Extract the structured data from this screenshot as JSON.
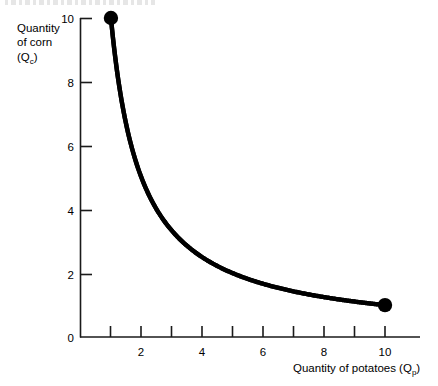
{
  "chart_data": {
    "type": "line",
    "title": "",
    "subtitle": "",
    "xlabel": "Quantity of potatoes (Qp)",
    "ylabel": "Quantity of corn (Qc)",
    "xlim": [
      0,
      11
    ],
    "ylim": [
      0,
      10
    ],
    "grid": false,
    "legend": "none",
    "x": [
      1,
      1.25,
      1.5,
      2,
      2.5,
      3,
      4,
      5,
      6,
      7,
      8,
      9,
      10
    ],
    "values": [
      10,
      8,
      6.67,
      5,
      4,
      3.33,
      2.5,
      2,
      1.67,
      1.43,
      1.25,
      1.11,
      1
    ],
    "relation": "Qc = 10 / Qp",
    "series": [
      {
        "name": "Indifference curve",
        "x": [
          1,
          1.25,
          1.5,
          2,
          2.5,
          3,
          4,
          5,
          6,
          7,
          8,
          9,
          10
        ],
        "values": [
          10,
          8,
          6.67,
          5,
          4,
          3.33,
          2.5,
          2,
          1.67,
          1.43,
          1.25,
          1.11,
          1
        ],
        "color": "#000000",
        "line_width": 4
      }
    ],
    "endpoints": [
      {
        "name": "left-endpoint",
        "x": 1,
        "y": 10,
        "marker": "filled-circle"
      },
      {
        "name": "right-endpoint",
        "x": 10,
        "y": 1,
        "marker": "filled-circle"
      }
    ],
    "x_ticks": [
      1,
      2,
      3,
      4,
      5,
      6,
      7,
      8,
      9,
      10
    ],
    "x_tick_labels": [
      "",
      "2",
      "",
      "4",
      "",
      "6",
      "",
      "8",
      "",
      "10"
    ],
    "y_ticks": [
      0,
      2,
      4,
      6,
      8,
      10
    ],
    "y_tick_labels": [
      "0",
      "2",
      "4",
      "6",
      "8",
      "10"
    ],
    "origin_label": "0"
  },
  "axes": {
    "y_title_lines": [
      "Quantity",
      "of corn",
      "(Q",
      "c",
      ")"
    ],
    "y_title_line1": "Quantity",
    "y_title_line2": "of corn",
    "y_title_line3_pre": "(Q",
    "y_title_line3_sub": "c",
    "y_title_line3_post": ")",
    "x_title_pre": "Quantity of potatoes (Q",
    "x_title_sub": "p",
    "x_title_post": ")",
    "axis_color": "#1a1a1a",
    "curve_color": "#000000"
  },
  "ticks": {
    "y": {
      "t10": "10",
      "t8": "8",
      "t6": "6",
      "t4": "4",
      "t2": "2",
      "t0": "0"
    },
    "x": {
      "t2": "2",
      "t4": "4",
      "t6": "6",
      "t8": "8",
      "t10": "10"
    }
  }
}
